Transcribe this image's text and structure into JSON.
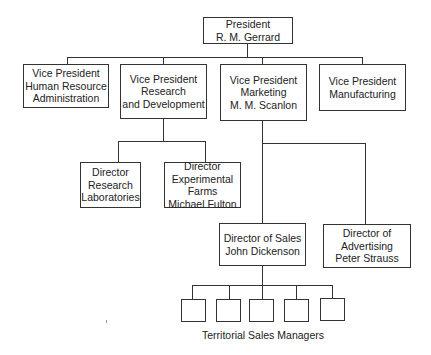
{
  "org_chart": {
    "president": {
      "lines": [
        "President",
        "R. M. Gerrard"
      ]
    },
    "vice_presidents": [
      {
        "id": "vp-hr",
        "lines": [
          "Vice President",
          "Human Resource",
          "Administration"
        ]
      },
      {
        "id": "vp-rnd",
        "lines": [
          "Vice President",
          "Research",
          "and Development"
        ]
      },
      {
        "id": "vp-marketing",
        "lines": [
          "Vice President",
          "Marketing",
          "M. M. Scanlon"
        ]
      },
      {
        "id": "vp-manufacturing",
        "lines": [
          "Vice President",
          "Manufacturing"
        ]
      }
    ],
    "rnd_directors": [
      {
        "id": "dir-research-labs",
        "lines": [
          "Director",
          "Research",
          "Laboratories"
        ]
      },
      {
        "id": "dir-experimental-farms",
        "lines": [
          "Director",
          "Experimental",
          "Farms",
          "Michael Fulton"
        ]
      }
    ],
    "marketing_directors": [
      {
        "id": "dir-sales",
        "lines": [
          "Director of Sales",
          "John Dickenson"
        ]
      },
      {
        "id": "dir-advertising",
        "lines": [
          "Director of",
          "Advertising",
          "Peter Strauss"
        ]
      }
    ],
    "territorial_sales_managers": {
      "count": 5,
      "caption": "Territorial Sales Managers"
    }
  }
}
